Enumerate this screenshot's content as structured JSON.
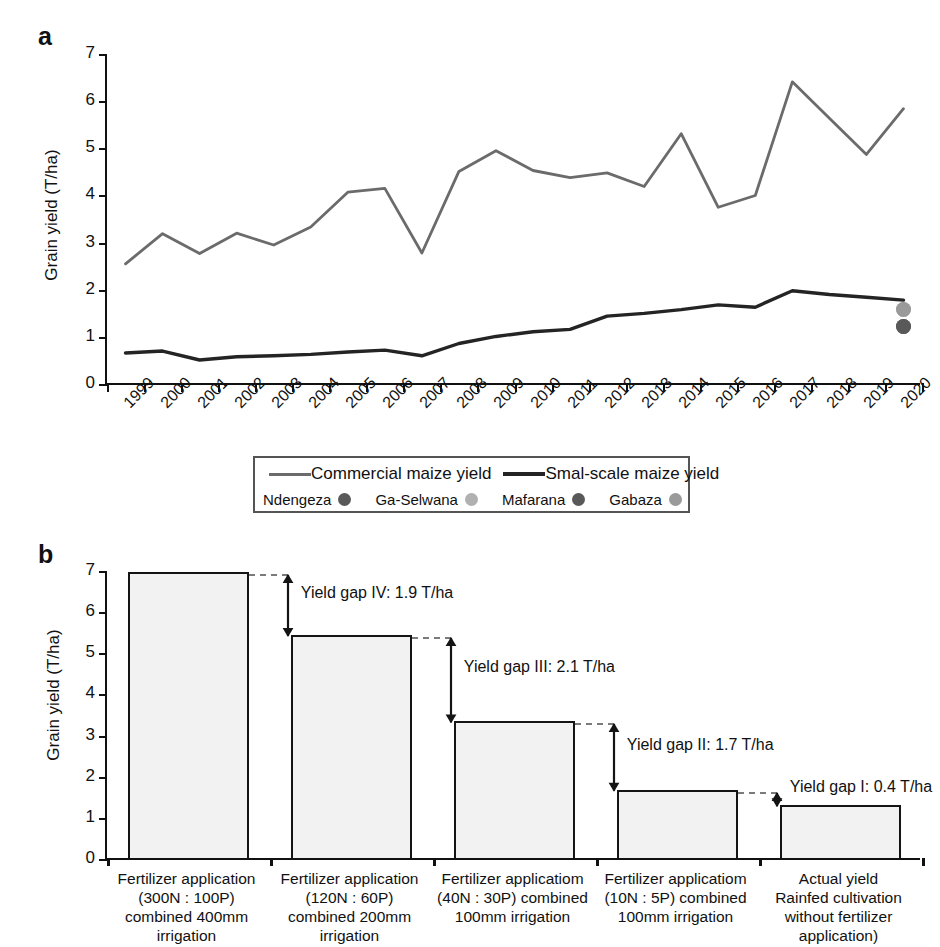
{
  "panel_a": {
    "letter": "a",
    "ylabel": "Grain yield (T/ha)",
    "yticks": [
      "0",
      "1",
      "2",
      "3",
      "4",
      "5",
      "6",
      "7"
    ],
    "legend": {
      "series": [
        {
          "label": "Commercial maize yield",
          "color": "#6b6b6b",
          "icon": "line-swatch"
        },
        {
          "label": "Smal-scale maize yield",
          "color": "#242424",
          "icon": "line-swatch-thick"
        }
      ],
      "sites": [
        {
          "label": "Ndengeza",
          "color": "#595959"
        },
        {
          "label": "Ga-Selwana",
          "color": "#b0b0b0"
        },
        {
          "label": "Mafarana",
          "color": "#595959"
        },
        {
          "label": "Gabaza",
          "color": "#9a9a9a"
        }
      ]
    }
  },
  "panel_b": {
    "letter": "b",
    "ylabel": "Grain yield (T/ha)",
    "yticks": [
      "0",
      "1",
      "2",
      "3",
      "4",
      "5",
      "6",
      "7"
    ],
    "gap_labels": [
      "Yield gap IV: 1.9 T/ha",
      "Yield gap III: 2.1 T/ha",
      "Yield gap II: 1.7 T/ha",
      "Yield gap I: 0.4 T/ha"
    ]
  },
  "chart_data": [
    {
      "type": "line",
      "title": "",
      "panel": "a",
      "xlabel": "",
      "ylabel": "Grain yield (T/ha)",
      "ylim": [
        0,
        7
      ],
      "ytick_step": 1,
      "grid": false,
      "legend_position": "bottom",
      "x": [
        "1999",
        "2000",
        "2001",
        "2002",
        "2003",
        "2004",
        "2005",
        "2006",
        "2007",
        "2008",
        "2009",
        "2010",
        "2011",
        "2012",
        "2013",
        "2014",
        "2015",
        "2016",
        "2017",
        "2018",
        "2019",
        "2020"
      ],
      "series": [
        {
          "name": "Commercial maize yield",
          "color": "#6b6b6b",
          "values": [
            2.57,
            3.21,
            2.79,
            3.22,
            2.97,
            3.35,
            4.09,
            4.17,
            2.8,
            4.53,
            4.97,
            4.55,
            4.4,
            4.5,
            4.21,
            5.33,
            3.77,
            4.02,
            6.43,
            5.66,
            4.89,
            5.86
          ]
        },
        {
          "name": "Smal-scale maize yield",
          "color": "#242424",
          "values": [
            0.68,
            0.72,
            0.53,
            0.6,
            0.62,
            0.65,
            0.7,
            0.74,
            0.62,
            0.88,
            1.03,
            1.13,
            1.18,
            1.46,
            1.52,
            1.6,
            1.7,
            1.65,
            2.0,
            1.92,
            1.86,
            1.8
          ]
        }
      ],
      "point_markers": [
        {
          "name": "Ndengeza",
          "x": "2020",
          "y": 1.25,
          "color": "#595959"
        },
        {
          "name": "Ga-Selwana",
          "x": "2020",
          "y": 1.6,
          "color": "#b0b0b0"
        },
        {
          "name": "Mafarana",
          "x": "2020",
          "y": 1.25,
          "color": "#595959"
        },
        {
          "name": "Gabaza",
          "x": "2020",
          "y": 1.6,
          "color": "#9a9a9a"
        }
      ]
    },
    {
      "type": "bar",
      "panel": "b",
      "title": "",
      "xlabel": "",
      "ylabel": "Grain yield (T/ha)",
      "ylim": [
        0,
        7
      ],
      "ytick_step": 1,
      "grid": false,
      "categories": [
        "Fertilizer application (300N : 100P) combined 400mm irrigation",
        "Fertilizer application (120N : 60P) combined 200mm irrigation",
        "Fertilizer applicatiom (40N : 30P) combined 100mm irrigation",
        "Fertilizer applicatiom (10N : 5P) combined 100mm irrigation",
        "Actual yield Rainfed cultivation without fertilizer application)"
      ],
      "category_lines": [
        [
          "Fertilizer application",
          "(300N : 100P)",
          "combined 400mm",
          "irrigation"
        ],
        [
          "Fertilizer application",
          "(120N : 60P)",
          "combined 200mm",
          "irrigation"
        ],
        [
          "Fertilizer applicatiom",
          "(40N : 30P) combined",
          "100mm irrigation"
        ],
        [
          "Fertilizer applicatiom",
          "(10N : 5P) combined",
          "100mm irrigation"
        ],
        [
          "Actual yield",
          "Rainfed cultivation",
          "without fertilizer",
          "application)"
        ]
      ],
      "values": [
        6.95,
        5.42,
        3.32,
        1.65,
        1.28
      ],
      "annotations": [
        {
          "label": "Yield gap IV: 1.9 T/ha",
          "from": 6.95,
          "to": 5.42,
          "value": 1.9
        },
        {
          "label": "Yield gap III: 2.1 T/ha",
          "from": 5.42,
          "to": 3.32,
          "value": 2.1
        },
        {
          "label": "Yield gap II: 1.7 T/ha",
          "from": 3.32,
          "to": 1.65,
          "value": 1.7
        },
        {
          "label": "Yield gap I: 0.4 T/ha",
          "from": 1.65,
          "to": 1.28,
          "value": 0.4
        }
      ]
    }
  ]
}
